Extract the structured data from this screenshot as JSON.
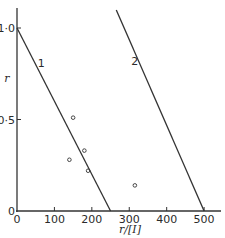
{
  "chart_data": {
    "type": "scatter",
    "title": "",
    "xlabel": "r/[I]",
    "ylabel": "r",
    "xlim": [
      0,
      550
    ],
    "ylim": [
      0,
      1.0
    ],
    "grid": false,
    "x_ticks": [
      0,
      100,
      200,
      300,
      400,
      500
    ],
    "x_tick_labels": [
      "0",
      "100",
      "200",
      "300",
      "400",
      "500"
    ],
    "y_ticks": [
      0,
      0.5,
      1.0
    ],
    "y_tick_labels": [
      "0",
      "0·5",
      "1·0"
    ],
    "series": [
      {
        "name": "1",
        "kind": "line",
        "points": [
          [
            0,
            1.0
          ],
          [
            250,
            0
          ]
        ]
      },
      {
        "name": "2",
        "kind": "line",
        "points": [
          [
            265,
            1.1
          ],
          [
            500,
            0
          ]
        ]
      },
      {
        "name": "data",
        "kind": "scatter",
        "marker": "open-circle",
        "points": [
          [
            150,
            0.51
          ],
          [
            180,
            0.33
          ],
          [
            140,
            0.28
          ],
          [
            190,
            0.22
          ],
          [
            315,
            0.14
          ]
        ]
      }
    ],
    "line_labels": [
      {
        "text": "1",
        "x": 65,
        "y": 0.81
      },
      {
        "text": "2",
        "x": 315,
        "y": 0.82
      }
    ]
  }
}
